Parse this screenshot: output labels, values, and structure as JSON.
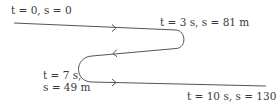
{
  "diagram": {
    "type": "motion-path",
    "stroke_color": "#555555",
    "text_color": "#3a3a3a",
    "labels": {
      "start": {
        "t": "t = 0, s = 0"
      },
      "first_turn": {
        "t": "t = 3 s, s = 81 m"
      },
      "second_turn_line1": "t = 7 s,",
      "second_turn_line2": "s = 49 m",
      "end": {
        "t": "t = 10 s, s = 130 m"
      }
    },
    "points": [
      {
        "t_s": 0,
        "s_m": 0
      },
      {
        "t_s": 3,
        "s_m": 81
      },
      {
        "t_s": 7,
        "s_m": 49
      },
      {
        "t_s": 10,
        "s_m": 130
      }
    ],
    "direction_arrows": [
      "right",
      "left",
      "right"
    ]
  }
}
